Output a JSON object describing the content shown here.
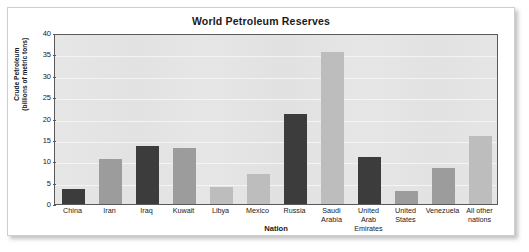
{
  "chart_data": {
    "type": "bar",
    "title": "World Petroleum Reserves",
    "xlabel": "Nation",
    "ylabel": "Crude Petroleum (billions of metric tons)",
    "ylabel_line1": "Crude Petroleum",
    "ylabel_line2": "(billions of metric tons)",
    "ylim": [
      0,
      40
    ],
    "ytick_values": [
      0,
      5,
      10,
      15,
      20,
      25,
      30,
      35,
      40
    ],
    "ytick_labels": [
      "0",
      "5",
      "10",
      "15",
      "20",
      "25",
      "30",
      "35",
      "40"
    ],
    "grid": true,
    "legend": null,
    "categories": [
      "China",
      "Iran",
      "Iraq",
      "Kuwait",
      "Libya",
      "Mexico",
      "Russia",
      "Saudi Arabia",
      "United Arab Emirates",
      "United States",
      "Venezuela",
      "All other nations"
    ],
    "category_label_lines": [
      [
        "China"
      ],
      [
        "Iran"
      ],
      [
        "Iraq"
      ],
      [
        "Kuwait"
      ],
      [
        "Libya"
      ],
      [
        "Mexico"
      ],
      [
        "Russia"
      ],
      [
        "Saudi",
        "Arabia"
      ],
      [
        "United Arab",
        "Emirates"
      ],
      [
        "United",
        "States"
      ],
      [
        "Venezuela"
      ],
      [
        "All other",
        "nations"
      ]
    ],
    "values": [
      3.5,
      10.5,
      13.5,
      13.0,
      4.0,
      7.0,
      21.0,
      35.5,
      11.0,
      3.0,
      8.5,
      16.0
    ],
    "bar_shades": [
      "dark",
      "medium",
      "dark",
      "medium",
      "light",
      "light",
      "dark",
      "light",
      "dark",
      "medium",
      "medium",
      "light"
    ]
  },
  "colors": {
    "bar_dark": "#3c3c3c",
    "bar_medium": "#9c9c9c",
    "bar_light": "#bdbdbd",
    "plot_background": "#e4e4e4",
    "gridline": "#f4f4f4",
    "axis_line": "#5a5a5a",
    "text": "#1a1a1a",
    "card_background": "#ffffff",
    "card_border": "#cfcfcf"
  }
}
